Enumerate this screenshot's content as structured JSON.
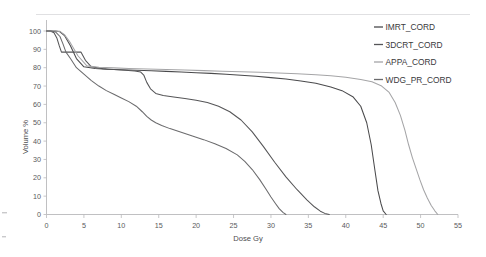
{
  "chart_data": {
    "type": "line",
    "title": "",
    "xlabel": "Dose Gy",
    "ylabel": "Volume %",
    "xlim": [
      0,
      55
    ],
    "ylim": [
      0,
      100
    ],
    "xticks": [
      0,
      5,
      10,
      15,
      20,
      25,
      30,
      35,
      40,
      45,
      50,
      55
    ],
    "yticks": [
      0,
      10,
      20,
      30,
      40,
      50,
      60,
      70,
      80,
      90,
      100
    ],
    "grid": false,
    "legend_position": "right",
    "series": [
      {
        "name": "IMRT_CORD",
        "color": "#4a4a4c",
        "x": [
          0,
          0.6,
          1.2,
          1.8,
          2.4,
          3.2,
          4.0,
          5.0,
          6.5,
          8.0,
          10.0,
          12.0,
          14.0,
          16.0,
          18.0,
          20.0,
          22.0,
          24.0,
          26.0,
          28.0,
          30.0,
          32.0,
          34.0,
          36.0,
          38.0,
          39.5,
          41.0,
          42.0,
          42.8,
          43.4,
          43.9,
          44.3,
          44.7,
          45.0,
          45.4
        ],
        "y": [
          100,
          100,
          100,
          99.6,
          97.5,
          92.0,
          85.0,
          80.5,
          79.6,
          79.2,
          78.9,
          78.6,
          78.3,
          78.0,
          77.7,
          77.3,
          76.9,
          76.4,
          75.9,
          75.3,
          74.6,
          73.8,
          72.8,
          71.5,
          69.5,
          67.5,
          64.0,
          59.0,
          50.0,
          38.0,
          24.0,
          13.0,
          6.0,
          2.0,
          0
        ]
      },
      {
        "name": "3DCRT_CORD",
        "color": "#555557",
        "x": [
          0,
          0.5,
          1.0,
          1.4,
          1.7,
          2.0,
          2.0,
          4.6,
          4.6,
          5.2,
          6.0,
          7.5,
          9.0,
          10.5,
          11.8,
          12.6,
          13.0,
          13.4,
          13.9,
          14.6,
          15.6,
          17.0,
          18.5,
          20.0,
          21.5,
          23.0,
          24.5,
          26.0,
          27.5,
          29.0,
          30.5,
          32.0,
          33.5,
          34.8,
          35.8,
          36.6,
          37.2,
          37.8
        ],
        "y": [
          100,
          100,
          99.0,
          96.0,
          92.0,
          88.5,
          88.5,
          88.5,
          88.5,
          84.0,
          80.5,
          79.5,
          79.0,
          78.6,
          78.2,
          77.6,
          76.0,
          72.0,
          68.5,
          66.0,
          64.8,
          64.0,
          63.2,
          62.3,
          61.0,
          59.0,
          56.0,
          51.5,
          45.0,
          37.0,
          28.5,
          20.5,
          13.5,
          8.0,
          4.2,
          1.8,
          0.6,
          0
        ]
      },
      {
        "name": "APPA_CORD",
        "color": "#a5a5a7",
        "x": [
          0,
          0.6,
          1.2,
          1.8,
          2.4,
          3.2,
          4.2,
          5.4,
          7.0,
          9.0,
          11.0,
          13.5,
          16.0,
          18.5,
          21.0,
          23.5,
          26.0,
          28.5,
          31.0,
          33.5,
          36.0,
          38.0,
          40.0,
          42.0,
          43.5,
          44.8,
          45.8,
          46.6,
          47.3,
          47.9,
          48.4,
          48.9,
          49.4,
          49.9,
          50.4,
          50.9,
          51.4,
          51.9,
          52.3
        ],
        "y": [
          100,
          100,
          100,
          99.8,
          98.0,
          93.5,
          86.5,
          81.0,
          80.2,
          79.9,
          79.6,
          79.3,
          79.0,
          78.7,
          78.4,
          78.1,
          77.8,
          77.5,
          77.1,
          76.7,
          76.2,
          75.6,
          74.8,
          73.6,
          72.3,
          70.0,
          66.5,
          61.0,
          54.0,
          46.0,
          38.0,
          31.0,
          25.0,
          19.0,
          13.5,
          9.0,
          5.0,
          2.0,
          0
        ]
      },
      {
        "name": "WDG_PR_CORD",
        "color": "#6b6b6d",
        "x": [
          0,
          0.6,
          1.2,
          1.8,
          2.2,
          2.6,
          3.2,
          4.0,
          5.0,
          6.0,
          7.0,
          8.0,
          9.0,
          10.0,
          11.0,
          12.0,
          12.8,
          13.4,
          14.0,
          14.6,
          15.4,
          16.5,
          18.0,
          19.5,
          21.0,
          22.5,
          24.0,
          25.5,
          26.5,
          27.5,
          28.5,
          29.3,
          30.0,
          30.6,
          31.1,
          31.6,
          32.0
        ],
        "y": [
          100,
          100,
          99.5,
          97.0,
          93.0,
          88.5,
          85.0,
          80.0,
          76.5,
          73.0,
          70.0,
          67.5,
          65.5,
          63.5,
          61.5,
          59.0,
          56.0,
          53.5,
          51.5,
          50.0,
          48.5,
          46.8,
          44.8,
          42.8,
          40.8,
          38.6,
          36.0,
          32.5,
          29.0,
          24.5,
          19.0,
          14.0,
          9.5,
          6.0,
          3.2,
          1.2,
          0
        ]
      }
    ]
  },
  "legend": {
    "items": [
      {
        "label": "IMRT_CORD"
      },
      {
        "label": "3DCRT_CORD"
      },
      {
        "label": "APPA_CORD"
      },
      {
        "label": "WDG_PR_CORD"
      }
    ]
  },
  "axes": {
    "x_title": "Dose Gy",
    "y_title": "Volume %"
  }
}
